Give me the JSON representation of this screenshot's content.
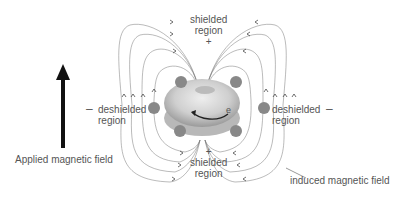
{
  "labels": {
    "top_shielded": "shielded",
    "top_region": "region",
    "top_sign": "+",
    "bottom_sign": "+",
    "bottom_shielded": "shielded",
    "bottom_region": "region",
    "left_sign": "–",
    "left_deshielded": "deshielded",
    "left_region": "region",
    "right_sign": "–",
    "right_deshielded": "deshielded",
    "right_region": "region",
    "electron": "e",
    "applied_field": "Applied magnetic field",
    "induced_field": "induced magnetic field"
  }
}
